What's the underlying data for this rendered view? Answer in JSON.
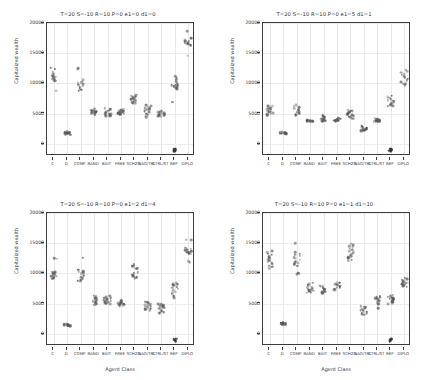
{
  "figure": {
    "width": 433,
    "height": 380,
    "background": "#ffffff",
    "marker_color": "#555555",
    "axis_color": "#3c3c3c",
    "grid_color": "#e9e9e9"
  },
  "chart_data": [
    {
      "type": "scatter",
      "panel": "top-left",
      "title": "T=20 S=-10 R=10 P=0 e1=0 d1=0",
      "xlabel": "",
      "ylabel": "Capitalized wealth",
      "categories": [
        "C",
        "D",
        "COMP",
        "RAND",
        "BAIT",
        "FREE",
        "SCH2D",
        "NAO/TRL",
        "CTRL/ST",
        "REP",
        "DIPLO"
      ],
      "yticks": [
        0,
        5000,
        10000,
        15000,
        20000
      ],
      "ylim": [
        -2000,
        20000
      ],
      "grid": true,
      "legend": "none",
      "series": [
        {
          "name": "C",
          "values": [
            12600,
            12450,
            11900,
            11600,
            11400,
            11200,
            11050,
            10900,
            10800,
            10700,
            10600,
            10500,
            10400,
            10300,
            8800
          ]
        },
        {
          "name": "D",
          "values": [
            2100,
            2000,
            1950,
            1900,
            1880,
            1850,
            1830,
            1800,
            1780,
            1750,
            1700,
            1650,
            1600,
            1550,
            1500
          ]
        },
        {
          "name": "COMP",
          "values": [
            12550,
            12400,
            10800,
            10600,
            10400,
            10200,
            10000,
            9900,
            9800,
            9700,
            9600,
            9400,
            9200,
            9000,
            8800
          ]
        },
        {
          "name": "RAND",
          "values": [
            5800,
            5700,
            5600,
            5500,
            5450,
            5400,
            5350,
            5300,
            5250,
            5200,
            5150,
            5100,
            5050,
            5000,
            4900
          ]
        },
        {
          "name": "BAIT",
          "values": [
            5900,
            5700,
            5500,
            5300,
            5200,
            5100,
            5000,
            4950,
            4900,
            4850,
            4800,
            4750,
            4700,
            4650,
            4600
          ]
        },
        {
          "name": "FREE",
          "values": [
            5700,
            5600,
            5500,
            5400,
            5300,
            5250,
            5200,
            5150,
            5100,
            5050,
            5000,
            4950,
            4900,
            4850,
            4800
          ]
        },
        {
          "name": "SCH2D",
          "values": [
            8100,
            8000,
            7900,
            7800,
            7700,
            7600,
            7500,
            7400,
            7300,
            7200,
            7100,
            7000,
            6900,
            6800,
            6700
          ]
        },
        {
          "name": "NAO/TRL",
          "values": [
            6500,
            6300,
            6200,
            6100,
            6000,
            5900,
            5800,
            5700,
            5600,
            5400,
            5200,
            5000,
            4800,
            4600,
            4400
          ]
        },
        {
          "name": "CTRL/ST",
          "values": [
            5500,
            5400,
            5300,
            5200,
            5100,
            5050,
            5000,
            4950,
            4900,
            4850,
            4800,
            4750,
            4700,
            4600,
            4500
          ]
        },
        {
          "name": "REP",
          "values": [
            11200,
            10900,
            10600,
            10300,
            10100,
            9900,
            9800,
            9700,
            9600,
            9500,
            9400,
            9300,
            9200,
            9100,
            7000
          ]
        },
        {
          "name": "DIPLO",
          "values": [
            18700,
            17600,
            17400,
            17200,
            17100,
            17000,
            16900,
            16800,
            16700,
            16600,
            16500,
            16400,
            16300,
            16200,
            14600
          ]
        }
      ],
      "special_low": {
        "REP": [
          -800,
          -900,
          -1000,
          -1100,
          -1200
        ]
      }
    },
    {
      "type": "scatter",
      "panel": "top-right",
      "title": "T=20 S=-10 R=10 P=0 e1=5 d1=1",
      "xlabel": "",
      "ylabel": "Capitalized wealth",
      "categories": [
        "C",
        "D",
        "COMP",
        "RAND",
        "BAIT",
        "FREE",
        "SCH2D",
        "NAO/TRL",
        "CTRL/ST",
        "REP",
        "DIPLO"
      ],
      "yticks": [
        0,
        5000,
        10000,
        15000,
        20000
      ],
      "ylim": [
        -2000,
        20000
      ],
      "grid": true,
      "legend": "none",
      "series": [
        {
          "name": "C",
          "values": [
            6300,
            6200,
            6000,
            5900,
            5800,
            5700,
            5600,
            5500,
            5400,
            5300,
            5200,
            5100,
            5000,
            4900,
            4700
          ]
        },
        {
          "name": "D",
          "values": [
            2000,
            1950,
            1900,
            1880,
            1860,
            1840,
            1820,
            1800,
            1780,
            1760,
            1740,
            1720,
            1700,
            1680,
            1650
          ]
        },
        {
          "name": "COMP",
          "values": [
            6400,
            6300,
            6100,
            5900,
            5700,
            5600,
            5500,
            5400,
            5300,
            5200,
            5100,
            5000,
            4900,
            4800,
            4700
          ]
        },
        {
          "name": "RAND",
          "values": [
            4000,
            3950,
            3900,
            3880,
            3860,
            3840,
            3820,
            3800,
            3780,
            3760,
            3740,
            3720,
            3700,
            3680,
            3650
          ]
        },
        {
          "name": "BAIT",
          "values": [
            4700,
            4600,
            4500,
            4400,
            4300,
            4200,
            4100,
            4050,
            4000,
            3950,
            3900,
            3850,
            3800,
            3750,
            3700
          ]
        },
        {
          "name": "FREE",
          "values": [
            4300,
            4200,
            4100,
            4050,
            4000,
            3950,
            3900,
            3880,
            3860,
            3840,
            3820,
            3800,
            3780,
            3760,
            3740
          ]
        },
        {
          "name": "SCH2D",
          "values": [
            5600,
            5500,
            5400,
            5300,
            5200,
            5100,
            5000,
            4900,
            4800,
            4700,
            4600,
            4500,
            4400,
            4300,
            4200
          ]
        },
        {
          "name": "NAO/TRL",
          "values": [
            3000,
            2900,
            2800,
            2700,
            2600,
            2550,
            2500,
            2450,
            2400,
            2350,
            2300,
            2250,
            2200,
            2150,
            2100
          ]
        },
        {
          "name": "CTRL/ST",
          "values": [
            4200,
            4100,
            4000,
            3950,
            3900,
            3880,
            3860,
            3840,
            3820,
            3800,
            3780,
            3760,
            3740,
            3720,
            3700
          ]
        },
        {
          "name": "REP",
          "values": [
            8000,
            7800,
            7600,
            7400,
            7200,
            7100,
            7000,
            6900,
            6800,
            6700,
            6600,
            6500,
            6400,
            6300,
            6200
          ]
        },
        {
          "name": "DIPLO",
          "values": [
            12200,
            12000,
            11800,
            11600,
            11400,
            11200,
            11000,
            10800,
            10600,
            10400,
            10200,
            10000,
            9900,
            9800,
            9700
          ]
        }
      ],
      "special_low": {
        "REP": [
          -800,
          -900,
          -1000,
          -1100,
          -1200
        ]
      }
    },
    {
      "type": "scatter",
      "panel": "bottom-left",
      "title": "T=20 S=-10 R=10 P=0 e1=2 d1=4",
      "xlabel": "Agent Class",
      "ylabel": "Capitalized wealth",
      "categories": [
        "C",
        "D",
        "COMP",
        "RAND",
        "BAIT",
        "FREE",
        "SCH2D",
        "NAO/TRL",
        "CTRL/ST",
        "REP",
        "DIPLO"
      ],
      "yticks": [
        0,
        5000,
        10000,
        15000,
        20000
      ],
      "ylim": [
        -2000,
        20000
      ],
      "grid": true,
      "legend": "none",
      "series": [
        {
          "name": "C",
          "values": [
            12500,
            12400,
            10300,
            10200,
            10100,
            10000,
            9900,
            9800,
            9700,
            9600,
            9500,
            9400,
            9300,
            9200,
            9100
          ]
        },
        {
          "name": "D",
          "values": [
            1700,
            1650,
            1600,
            1580,
            1550,
            1530,
            1500,
            1480,
            1450,
            1430,
            1400,
            1380,
            1350,
            1330,
            1300
          ]
        },
        {
          "name": "COMP",
          "values": [
            12600,
            10600,
            10400,
            10300,
            10200,
            10100,
            10000,
            9800,
            9600,
            9400,
            9200,
            9000,
            8900,
            8800,
            8700
          ]
        },
        {
          "name": "RAND",
          "values": [
            6300,
            6200,
            6000,
            5900,
            5800,
            5700,
            5600,
            5500,
            5400,
            5300,
            5200,
            5100,
            5000,
            4900,
            4800
          ]
        },
        {
          "name": "BAIT",
          "values": [
            6300,
            6200,
            6100,
            6000,
            5900,
            5800,
            5700,
            5600,
            5500,
            5400,
            5300,
            5200,
            5100,
            5000,
            4900
          ]
        },
        {
          "name": "FREE",
          "values": [
            5600,
            5500,
            5400,
            5300,
            5200,
            5100,
            5050,
            5000,
            4950,
            4900,
            4850,
            4800,
            4750,
            4700,
            4600
          ]
        },
        {
          "name": "SCH2D",
          "values": [
            11500,
            11300,
            11200,
            11100,
            11000,
            10900,
            10800,
            10200,
            10000,
            9800,
            9600,
            9500,
            9400,
            9300,
            9200
          ]
        },
        {
          "name": "NAO/TRL",
          "values": [
            5300,
            5200,
            5100,
            5000,
            4900,
            4800,
            4700,
            4600,
            4500,
            4400,
            4300,
            4200,
            4100,
            4000,
            3900
          ]
        },
        {
          "name": "CTRL/ST",
          "values": [
            5000,
            4900,
            4800,
            4700,
            4600,
            4500,
            4400,
            4300,
            4200,
            4000,
            3800,
            3700,
            3600,
            3500,
            3400
          ]
        },
        {
          "name": "REP",
          "values": [
            8500,
            8300,
            8200,
            8100,
            8000,
            7800,
            7600,
            7400,
            7200,
            7000,
            6800,
            6600,
            6400,
            6200,
            6000
          ]
        },
        {
          "name": "DIPLO",
          "values": [
            15600,
            15500,
            14200,
            14100,
            14000,
            13900,
            13800,
            13700,
            13600,
            13500,
            13400,
            13300,
            13200,
            12000,
            11900
          ]
        }
      ],
      "special_low": {
        "REP": [
          -800,
          -900,
          -1000,
          -1100,
          -1200
        ]
      }
    },
    {
      "type": "scatter",
      "panel": "bottom-right",
      "title": "T=20 S=-10 R=10 P=0 e1=1 d1=10",
      "xlabel": "Agent Class",
      "ylabel": "Capitalized wealth",
      "categories": [
        "C",
        "D",
        "COMP",
        "RAND",
        "BAIT",
        "FREE",
        "SCH2D",
        "NAO/TRL",
        "CTRL/ST",
        "REP",
        "DIPLO"
      ],
      "yticks": [
        0,
        5000,
        10000,
        15000,
        20000
      ],
      "ylim": [
        -2000,
        20000
      ],
      "grid": true,
      "legend": "none",
      "series": [
        {
          "name": "C",
          "values": [
            13700,
            13500,
            13300,
            13100,
            12900,
            12700,
            12500,
            12300,
            12100,
            11900,
            11700,
            11500,
            11300,
            11100,
            10900
          ]
        },
        {
          "name": "D",
          "values": [
            1900,
            1880,
            1850,
            1830,
            1800,
            1780,
            1750,
            1730,
            1700,
            1680,
            1650,
            1630,
            1600,
            1580,
            1550
          ]
        },
        {
          "name": "COMP",
          "values": [
            15000,
            13500,
            13300,
            13100,
            12900,
            12700,
            12500,
            12300,
            12100,
            11900,
            11700,
            11500,
            11300,
            10000,
            9900
          ]
        },
        {
          "name": "RAND",
          "values": [
            8500,
            8300,
            8100,
            7900,
            7800,
            7700,
            7600,
            7500,
            7400,
            7300,
            7200,
            7100,
            7000,
            6900,
            6800
          ]
        },
        {
          "name": "BAIT",
          "values": [
            8000,
            7900,
            7800,
            7700,
            7600,
            7500,
            7400,
            7300,
            7200,
            7100,
            7000,
            6900,
            6800,
            6700,
            6600
          ]
        },
        {
          "name": "FREE",
          "values": [
            8600,
            8500,
            8400,
            8300,
            8200,
            8100,
            8000,
            7900,
            7800,
            7700,
            7600,
            7500,
            7400,
            7300,
            7200
          ]
        },
        {
          "name": "SCH2D",
          "values": [
            14900,
            14700,
            14500,
            14300,
            14100,
            13900,
            13700,
            13500,
            13300,
            13100,
            12900,
            12700,
            12500,
            12300,
            12100
          ]
        },
        {
          "name": "NAO/TRL",
          "values": [
            4600,
            4500,
            4400,
            4300,
            4200,
            4100,
            4000,
            3900,
            3800,
            3700,
            3600,
            3500,
            3400,
            3300,
            3200
          ]
        },
        {
          "name": "CTRL/ST",
          "values": [
            6200,
            6100,
            6000,
            5900,
            5800,
            5700,
            5600,
            5500,
            5400,
            5300,
            5200,
            5100,
            5000,
            4900,
            4300
          ]
        },
        {
          "name": "REP",
          "values": [
            6400,
            6300,
            6200,
            6100,
            6000,
            5900,
            5800,
            5700,
            5600,
            5500,
            5400,
            5300,
            5200,
            5100,
            5000
          ]
        },
        {
          "name": "DIPLO",
          "values": [
            9200,
            9100,
            9000,
            8900,
            8800,
            8700,
            8600,
            8500,
            8400,
            8300,
            8200,
            8100,
            8000,
            7900,
            7800
          ]
        }
      ],
      "special_low": {
        "REP": [
          -800,
          -900,
          -1000,
          -1100,
          -1200
        ]
      }
    }
  ]
}
